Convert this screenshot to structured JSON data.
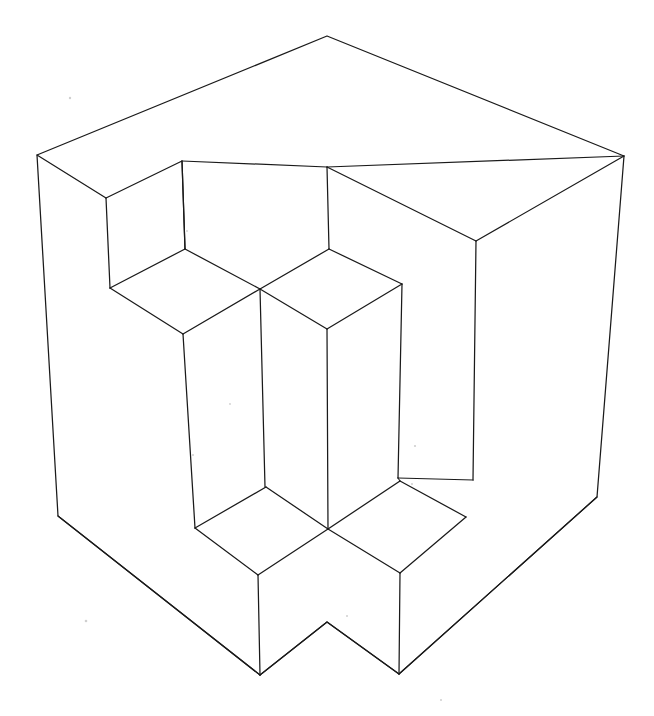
{
  "document": {
    "kind": "line-drawing",
    "title": "Isometric cube with cubic notches",
    "background_color": "#ffffff",
    "stroke_color": "#1a1a1a",
    "stroke_width": 1.25,
    "width": 654,
    "height": 716
  },
  "figure": {
    "name": "notched-isometric-cube",
    "vertices": {
      "top_apex": [
        327,
        36
      ],
      "left_top_corner": [
        37,
        155
      ],
      "right_top_corner": [
        624,
        156
      ],
      "left_bottom_corner": [
        58,
        516
      ],
      "right_bottom_corner": [
        597,
        497
      ],
      "bottom_left_foot": [
        260,
        675
      ],
      "bottom_right_foot": [
        399,
        674
      ],
      "bottom_mid_peak": [
        327,
        622
      ],
      "center_cross": [
        260,
        289
      ],
      "lower_cross": [
        328,
        529
      ],
      "notch_tl_top": [
        182,
        161
      ],
      "notch_tl_left": [
        106,
        198
      ],
      "notch_tl_inner": [
        185,
        249
      ],
      "notch_tl_bottomleft": [
        110,
        288
      ],
      "notch_tl_bottom": [
        183,
        334
      ],
      "notch_tr_top": [
        327,
        167
      ],
      "notch_tr_inner": [
        329,
        249
      ],
      "notch_tr_right": [
        402,
        284
      ],
      "notch_tr_bottom": [
        327,
        329
      ],
      "right_inner_top": [
        476,
        241
      ],
      "right_wall_left_top": [
        398,
        284
      ],
      "right_wall_left_bottom": [
        398,
        478
      ],
      "right_wall_right_bottom": [
        473,
        480
      ],
      "pocket_bl_top": [
        266,
        487
      ],
      "pocket_bl_left": [
        195,
        528
      ],
      "pocket_bl_inner": [
        258,
        575
      ],
      "pocket_br_top": [
        400,
        481
      ],
      "pocket_br_right": [
        466,
        517
      ],
      "pocket_br_bottom": [
        400,
        573
      ],
      "column_mid_top": [
        263,
        300
      ],
      "column_mid_bottom": [
        265,
        487
      ]
    },
    "paths": {
      "outer_silhouette": "M 37 155 L 327 36 L 624 156 L 597 497 L 399 674 L 327 622 L 260 675 L 58 516 Z",
      "top_face_left_edge": "M 37 155 L 106 198",
      "top_face_notch_left": "M 106 198 L 182 161 L 185 249",
      "top_face_notch_right": "M 327 167 L 624 156",
      "top_face_inner_a": "M 182 161 L 327 167",
      "top_face_inner_b": "M 327 167 L 476 241",
      "right_top_to_inner": "M 624 156 L 476 241",
      "notch_tl_vertical_left": "M 106 198 L 110 288",
      "notch_tl_vertical_mid": "M 182 161 L 185 249",
      "notch_tl_floor_a": "M 110 288 L 183 334",
      "notch_tl_floor_b": "M 183 334 L 260 289",
      "notch_tl_floor_c": "M 185 249 L 260 289",
      "notch_tl_floor_d": "M 110 288 L 185 249",
      "notch_tr_vertical": "M 327 167 L 329 249",
      "notch_tr_face_a": "M 329 249 L 402 284",
      "notch_tr_face_b": "M 260 289 L 329 249",
      "notch_tr_face_c": "M 260 289 L 327 329",
      "notch_tr_face_d": "M 327 329 L 402 284",
      "right_inner_vertical": "M 476 241 L 473 480",
      "column_right_vertical": "M 402 284 L 398 478",
      "column_center_vertical": "M 260 289 L 265 487",
      "column_left_vertical": "M 183 334 L 195 528",
      "column_front_vertical": "M 327 329 L 328 529",
      "right_wall_floor_a": "M 398 478 L 473 480",
      "right_wall_floor_b": "M 398 478 L 400 481",
      "pocket_bl_edge_a": "M 195 528 L 266 487",
      "pocket_bl_edge_b": "M 266 487 L 328 529",
      "pocket_bl_edge_c": "M 195 528 L 258 575",
      "pocket_bl_edge_d": "M 258 575 L 328 529",
      "pocket_bl_drop": "M 258 575 L 260 675",
      "pocket_br_edge_a": "M 328 529 L 400 481",
      "pocket_br_edge_b": "M 400 481 L 466 517",
      "pocket_br_edge_c": "M 328 529 L 400 573",
      "pocket_br_edge_d": "M 400 573 L 466 517",
      "pocket_br_drop": "M 400 573 L 399 674",
      "left_bottom_edge": "M 58 516 L 260 675",
      "right_bottom_edge": "M 399 674 L 597 497",
      "bottom_notch_v": "M 260 675 L 327 622 L 399 674"
    }
  },
  "specks": [
    {
      "x": 70,
      "y": 98,
      "r": 1.2
    },
    {
      "x": 86,
      "y": 621,
      "r": 1.3
    },
    {
      "x": 415,
      "y": 446,
      "r": 1.1
    },
    {
      "x": 412,
      "y": 484,
      "r": 1.0
    },
    {
      "x": 193,
      "y": 455,
      "r": 1.0
    },
    {
      "x": 347,
      "y": 616,
      "r": 1.0
    },
    {
      "x": 441,
      "y": 700,
      "r": 1.0
    },
    {
      "x": 187,
      "y": 231,
      "r": 0.9
    },
    {
      "x": 230,
      "y": 404,
      "r": 0.9
    }
  ]
}
